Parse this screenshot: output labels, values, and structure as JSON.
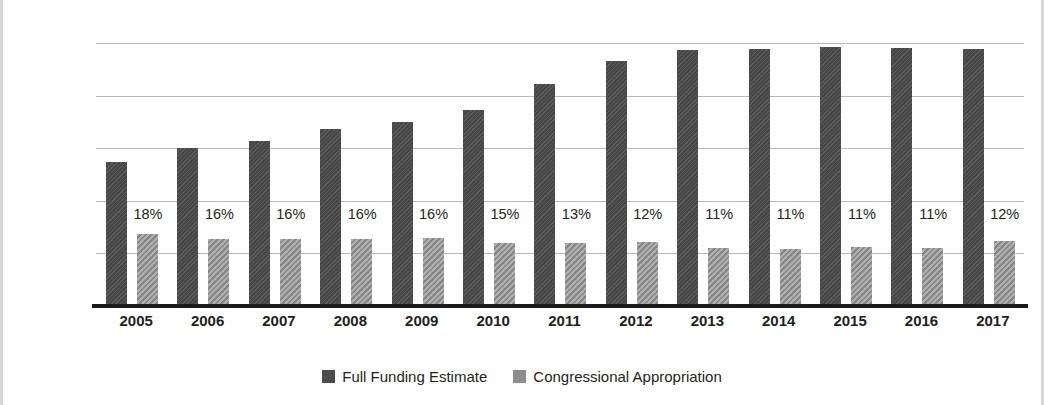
{
  "chart_data": {
    "type": "bar",
    "title": "",
    "xlabel": "",
    "ylabel": "In Billions",
    "ylim": [
      0,
      50
    ],
    "ytick_values": [
      50,
      40,
      30,
      20,
      10,
      0
    ],
    "ytick_labels": [
      "$50",
      "$40",
      "$30",
      "$20",
      "$10",
      "$0"
    ],
    "grid": true,
    "legend_position": "bottom-center",
    "categories": [
      "2005",
      "2006",
      "2007",
      "2008",
      "2009",
      "2010",
      "2011",
      "2012",
      "2013",
      "2014",
      "2015",
      "2016",
      "2017"
    ],
    "series": [
      {
        "name": "Full Funding Estimate",
        "color": "#4b4b4b",
        "values": [
          27.4,
          30.1,
          31.4,
          33.6,
          35.0,
          37.2,
          42.2,
          46.6,
          48.7,
          48.9,
          49.2,
          49.0,
          48.8
        ]
      },
      {
        "name": "Congressional Appropriation",
        "color": "#8d8d8d",
        "values": [
          13.6,
          12.7,
          12.8,
          12.8,
          12.9,
          11.9,
          12.0,
          12.1,
          11.0,
          10.9,
          11.2,
          11.1,
          12.3
        ]
      }
    ],
    "annotations": {
      "label": "percent of full funding estimate appropriated",
      "values": [
        "18%",
        "16%",
        "16%",
        "16%",
        "16%",
        "15%",
        "13%",
        "12%",
        "11%",
        "11%",
        "11%",
        "11%",
        "12%"
      ]
    }
  }
}
